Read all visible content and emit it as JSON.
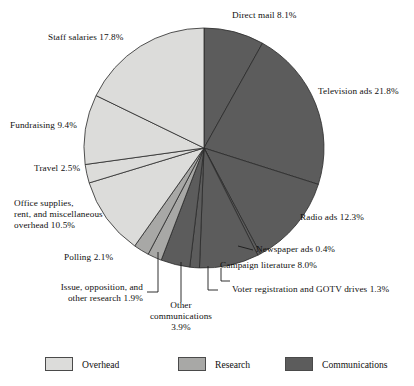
{
  "chart_data": {
    "type": "pie",
    "title": "",
    "total": 100.0,
    "units": "percent",
    "center": {
      "x": 204,
      "y": 148
    },
    "radius": 120,
    "start_angle_deg": 0,
    "direction": "clockwise",
    "legend": {
      "position": "bottom",
      "entries": [
        {
          "label": "Overhead",
          "color": "#dcdcda"
        },
        {
          "label": "Research",
          "color": "#a8a8a6"
        },
        {
          "label": "Communications",
          "color": "#5c5c5c"
        }
      ]
    },
    "categories": [
      "Direct mail",
      "Television ads",
      "Radio ads",
      "Newspaper ads",
      "Campaign literature",
      "Voter registration and GOTV drives",
      "Other communications",
      "Issue, opposition, and other research",
      "Polling",
      "Office supplies, rent, and miscellaneous overhead",
      "Travel",
      "Fundraising",
      "Staff salaries"
    ],
    "values": [
      8.1,
      21.8,
      12.3,
      0.4,
      8.0,
      1.3,
      3.9,
      1.9,
      2.1,
      10.5,
      2.5,
      9.4,
      17.8
    ],
    "slices": [
      {
        "name": "direct-mail",
        "label": "Direct mail 8.1%",
        "value": 8.1,
        "group": "Communications",
        "color": "#5c5c5c"
      },
      {
        "name": "television-ads",
        "label": "Television ads 21.8%",
        "value": 21.8,
        "group": "Communications",
        "color": "#5c5c5c"
      },
      {
        "name": "radio-ads",
        "label": "Radio ads 12.3%",
        "value": 12.3,
        "group": "Communications",
        "color": "#5c5c5c"
      },
      {
        "name": "newspaper-ads",
        "label": "Newspaper ads 0.4%",
        "value": 0.4,
        "group": "Communications",
        "color": "#5c5c5c"
      },
      {
        "name": "campaign-literature",
        "label": "Campaign literature 8.0%",
        "value": 8.0,
        "group": "Communications",
        "color": "#5c5c5c"
      },
      {
        "name": "voter-registration-gotv",
        "label": "Voter registration and GOTV drives 1.3%",
        "value": 1.3,
        "group": "Communications",
        "color": "#5c5c5c"
      },
      {
        "name": "other-communications",
        "label": "Other communications 3.9%",
        "value": 3.9,
        "group": "Communications",
        "color": "#5c5c5c"
      },
      {
        "name": "issue-opposition-research",
        "label": "Issue, opposition, and other research 1.9%",
        "value": 1.9,
        "group": "Research",
        "color": "#a8a8a6"
      },
      {
        "name": "polling",
        "label": "Polling 2.1%",
        "value": 2.1,
        "group": "Research",
        "color": "#a8a8a6"
      },
      {
        "name": "office-supplies-rent-overhead",
        "label": "Office supplies, rent, and miscellaneous overhead 10.5%",
        "value": 10.5,
        "group": "Overhead",
        "color": "#dcdcda"
      },
      {
        "name": "travel",
        "label": "Travel 2.5%",
        "value": 2.5,
        "group": "Overhead",
        "color": "#dcdcda"
      },
      {
        "name": "fundraising",
        "label": "Fundraising 9.4%",
        "value": 9.4,
        "group": "Overhead",
        "color": "#dcdcda"
      },
      {
        "name": "staff-salaries",
        "label": "Staff salaries 17.8%",
        "value": 17.8,
        "group": "Overhead",
        "color": "#dcdcda"
      }
    ]
  },
  "labels": {
    "direct_mail": "Direct mail 8.1%",
    "television_ads": "Television ads 21.8%",
    "radio_ads": "Radio ads 12.3%",
    "newspaper_ads": "Newspaper ads 0.4%",
    "campaign_literature": "Campaign literature 8.0%",
    "voter_registration": "Voter registration and GOTV drives 1.3%",
    "other_communications_l1": "Other",
    "other_communications_l2": "communications",
    "other_communications_l3": "3.9%",
    "issue_research_l1": "Issue, opposition, and",
    "issue_research_l2": "other research 1.9%",
    "polling": "Polling 2.1%",
    "office_supplies_l1": "Office supplies,",
    "office_supplies_l2": "rent, and miscellaneous",
    "office_supplies_l3": "overhead 10.5%",
    "travel": "Travel 2.5%",
    "fundraising": "Fundraising 9.4%",
    "staff_salaries": "Staff salaries 17.8%"
  },
  "legend": {
    "overhead": "Overhead",
    "research": "Research",
    "communications": "Communications"
  }
}
